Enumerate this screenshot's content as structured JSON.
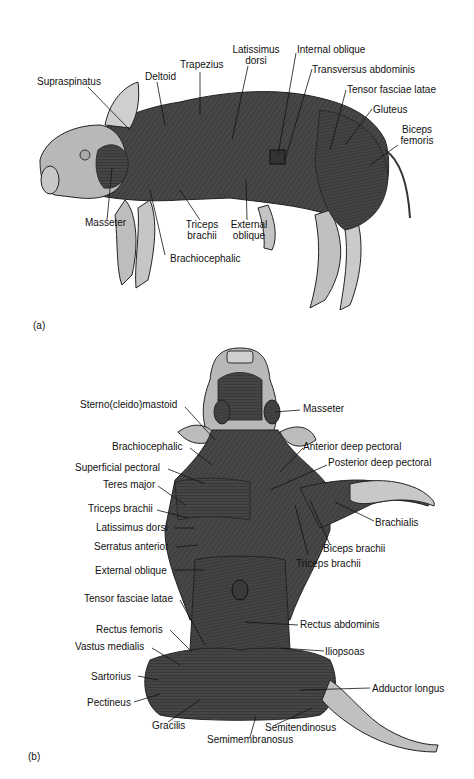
{
  "figure_a": {
    "panel_label": "(a)",
    "view": "lateral",
    "labels": {
      "supraspinatus": "Supraspinatus",
      "deltoid": "Deltoid",
      "trapezius": "Trapezius",
      "latissimus_dorsi_1": "Latissimus",
      "latissimus_dorsi_2": "dorsi",
      "internal_oblique": "Internal oblique",
      "transversus_abdominis": "Transversus abdominis",
      "tensor_fasciae_latae": "Tensor fasciae latae",
      "gluteus": "Gluteus",
      "biceps_femoris_1": "Biceps",
      "biceps_femoris_2": "femoris",
      "masseter": "Masseter",
      "triceps_brachii_1": "Triceps",
      "triceps_brachii_2": "brachii",
      "external_oblique_1": "External",
      "external_oblique_2": "oblique",
      "brachiocephalic": "Brachiocephalic"
    }
  },
  "figure_b": {
    "panel_label": "(b)",
    "view": "ventral",
    "labels": {
      "sternocleidomastoid": "Sterno(cleido)mastoid",
      "masseter": "Masseter",
      "brachiocephalic": "Brachiocephalic",
      "anterior_deep_pectoral": "Anterior deep pectoral",
      "posterior_deep_pectoral": "Posterior deep pectoral",
      "superficial_pectoral": "Superficial pectoral",
      "teres_major": "Teres major",
      "triceps_brachii_left": "Triceps brachii",
      "brachialis": "Brachialis",
      "latissimus_dorsi": "Latissimus dorsi",
      "serratus_anterior": "Serratus anterior",
      "biceps_brachii": "Biceps brachii",
      "triceps_brachii_right": "Triceps brachii",
      "external_oblique": "External oblique",
      "tensor_fasciae_latae": "Tensor fasciae latae",
      "rectus_abdominis": "Rectus abdominis",
      "rectus_femoris": "Rectus femoris",
      "vastus_medialis": "Vastus medialis",
      "iliopsoas": "Iliopsoas",
      "sartorius": "Sartorius",
      "adductor_longus": "Adductor longus",
      "pectineus": "Pectineus",
      "gracilis": "Gracilis",
      "semitendinosus": "Semitendinosus",
      "semimembranosus": "Semimembranosus"
    }
  },
  "colors": {
    "muscle": "#4a4a4a",
    "muscle_dark": "#333333",
    "skin": "#b8b8b8",
    "skin_light": "#d4d4d4",
    "leader_line": "#111111",
    "text": "#111111",
    "background": "#ffffff"
  }
}
